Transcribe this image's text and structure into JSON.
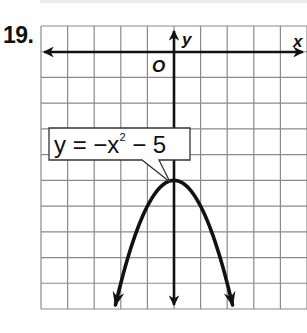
{
  "problem": {
    "number": "19."
  },
  "graph": {
    "x_axis_label": "x",
    "y_axis_label": "y",
    "origin_label": "O",
    "grid": {
      "columns": 10,
      "rows": 11,
      "x_range": [
        -5,
        5
      ],
      "y_range": [
        -10,
        1
      ]
    },
    "callout": {
      "prefix": "y = −x",
      "exponent": "2",
      "suffix": " − 5"
    },
    "colors": {
      "grid": "#8a8a8a",
      "ink": "#111111",
      "background": "#ffffff"
    }
  },
  "chart_data": {
    "type": "line",
    "title": "",
    "equation": "y = -x^2 - 5",
    "xlabel": "x",
    "ylabel": "y",
    "xlim": [
      -5,
      5
    ],
    "ylim": [
      -10,
      1
    ],
    "grid": true,
    "vertex": [
      0,
      -5
    ],
    "x": [
      -2.2,
      -2,
      -1.5,
      -1,
      -0.5,
      0,
      0.5,
      1,
      1.5,
      2,
      2.2
    ],
    "y": [
      -9.84,
      -9,
      -7.25,
      -6,
      -5.25,
      -5,
      -5.25,
      -6,
      -7.25,
      -9,
      -9.84
    ],
    "annotations": [
      "y = −x² − 5"
    ]
  }
}
